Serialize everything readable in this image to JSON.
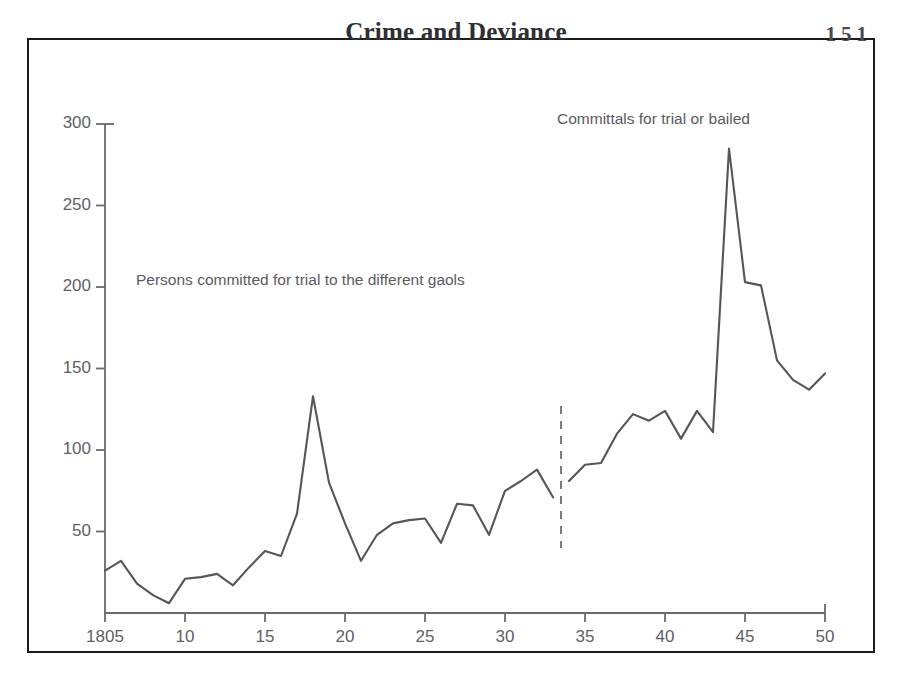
{
  "header": {
    "title": "Crime and Deviance",
    "page_number": "151"
  },
  "annotations": {
    "left": "Persons committed for trial to the different gaols",
    "right": "Committals for trial or bailed"
  },
  "colors": {
    "frame": "#1c1c1c",
    "line": "#55555a",
    "axis": "#6a6a6f",
    "text": "#5f5f64",
    "title": "#2e2e33",
    "background": "#ffffff"
  },
  "chart_data": {
    "type": "line",
    "title": "",
    "xlabel": "",
    "ylabel": "",
    "xlim": [
      1805,
      1850
    ],
    "ylim": [
      0,
      300
    ],
    "grid": false,
    "legend": "none",
    "y_ticks": [
      300,
      250,
      200,
      150,
      100,
      50
    ],
    "x_ticks": [
      1805,
      1810,
      1815,
      1820,
      1825,
      1830,
      1835,
      1840,
      1845,
      1850
    ],
    "x_tick_labels": [
      "1805",
      "10",
      "15",
      "20",
      "25",
      "30",
      "35",
      "40",
      "45",
      "50"
    ],
    "break_line_x": 1833.5,
    "annotations": [
      {
        "text": "Persons committed for trial to the different gaols",
        "x": 1807,
        "y": 213
      },
      {
        "text": "Committals for trial or bailed",
        "x": 1833,
        "y": 303
      }
    ],
    "series": [
      {
        "name": "Persons committed for trial to the different gaols",
        "x": [
          1805,
          1806,
          1807,
          1808,
          1809,
          1810,
          1811,
          1812,
          1813,
          1814,
          1815,
          1816,
          1817,
          1818,
          1819,
          1820,
          1821,
          1822,
          1823,
          1824,
          1825,
          1826,
          1827,
          1828,
          1829,
          1830,
          1831,
          1832,
          1833
        ],
        "values": [
          26,
          32,
          18,
          11,
          6,
          21,
          22,
          24,
          17,
          28,
          38,
          35,
          61,
          133,
          80,
          55,
          32,
          48,
          55,
          57,
          58,
          43,
          67,
          66,
          48,
          75,
          81,
          88,
          71
        ]
      },
      {
        "name": "Committals for trial or bailed",
        "x": [
          1834,
          1835,
          1836,
          1837,
          1838,
          1839,
          1840,
          1841,
          1842,
          1843,
          1844,
          1845,
          1846,
          1847,
          1848,
          1849,
          1850
        ],
        "values": [
          81,
          91,
          92,
          110,
          122,
          118,
          124,
          107,
          124,
          111,
          285,
          203,
          201,
          155,
          143,
          137,
          147
        ]
      }
    ]
  }
}
